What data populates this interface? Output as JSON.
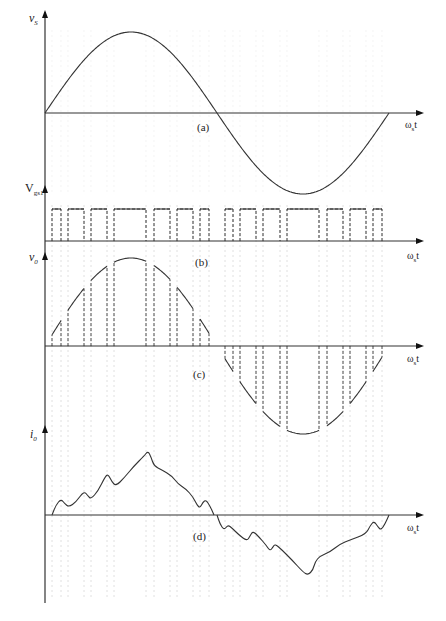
{
  "figure": {
    "stroke_color": "#333333",
    "grid_color": "#d8d8d8",
    "axis_x": 45,
    "axis_y_top": 8,
    "axis_y_bottom": 603,
    "x_end": 424,
    "period_start": 45,
    "period_end": 389
  },
  "panels": [
    {
      "id": "a",
      "caption": "(a)",
      "ylabel": "v",
      "ylabel_sub": "S",
      "xlabel": "ω",
      "xlabel_sub": "s",
      "xlabel_suffix": "t",
      "axis_y": 113,
      "ytop": 10,
      "caption_pos": [
        197,
        121
      ],
      "ylabel_pos": [
        29,
        11
      ],
      "xlabel_pos": [
        405,
        119
      ],
      "signal": "sine",
      "amplitude": 81
    },
    {
      "id": "b",
      "caption": "(b)",
      "ylabel": "V",
      "ylabel_sub": "gs1",
      "xlabel": "ω",
      "xlabel_sub": "s",
      "xlabel_suffix": "t",
      "axis_y": 241,
      "ytop": 185,
      "caption_pos": [
        195,
        256
      ],
      "ylabel_pos": [
        25,
        181
      ],
      "xlabel_pos": [
        407,
        250
      ],
      "signal": "pulses",
      "pulse_top": 209
    },
    {
      "id": "c",
      "caption": "(c)",
      "ylabel": "v",
      "ylabel_sub": "0",
      "xlabel": "ω",
      "xlabel_sub": "s",
      "xlabel_suffix": "t",
      "axis_y": 346,
      "ytop": 252,
      "caption_pos": [
        193,
        368
      ],
      "ylabel_pos": [
        29,
        250
      ],
      "xlabel_pos": [
        407,
        353
      ],
      "signal": "chopped_sine",
      "amplitude": 88
    },
    {
      "id": "d",
      "caption": "(d)",
      "ylabel": "i",
      "ylabel_sub": "0",
      "xlabel": "ω",
      "xlabel_sub": "s",
      "xlabel_suffix": "t",
      "axis_y": 515,
      "ytop": 425,
      "caption_pos": [
        193,
        530
      ],
      "ylabel_pos": [
        30,
        427
      ],
      "xlabel_pos": [
        407,
        522
      ],
      "signal": "current",
      "points_pos": [
        [
          52,
          515
        ],
        [
          56,
          505
        ],
        [
          61,
          499
        ],
        [
          65,
          504
        ],
        [
          69,
          507
        ],
        [
          76,
          502
        ],
        [
          84,
          491
        ],
        [
          88,
          496
        ],
        [
          91,
          499
        ],
        [
          98,
          491
        ],
        [
          105,
          477
        ],
        [
          108,
          474
        ],
        [
          112,
          482
        ],
        [
          116,
          486
        ],
        [
          124,
          478
        ],
        [
          134,
          466
        ],
        [
          144,
          456
        ],
        [
          148,
          451
        ],
        [
          151,
          457
        ],
        [
          154,
          466
        ],
        [
          162,
          470
        ],
        [
          172,
          476
        ],
        [
          178,
          484
        ],
        [
          186,
          489
        ],
        [
          193,
          497
        ],
        [
          197,
          505
        ],
        [
          200,
          508
        ],
        [
          203,
          502
        ],
        [
          206,
          500
        ],
        [
          210,
          506
        ],
        [
          214,
          515
        ]
      ],
      "points_neg": [
        [
          217,
          515
        ],
        [
          220,
          524
        ],
        [
          224,
          530
        ],
        [
          228,
          525
        ],
        [
          232,
          528
        ],
        [
          239,
          535
        ],
        [
          247,
          541
        ],
        [
          250,
          536
        ],
        [
          253,
          531
        ],
        [
          259,
          537
        ],
        [
          266,
          545
        ],
        [
          270,
          551
        ],
        [
          273,
          547
        ],
        [
          275,
          544
        ],
        [
          281,
          549
        ],
        [
          292,
          560
        ],
        [
          303,
          572
        ],
        [
          308,
          575
        ],
        [
          313,
          570
        ],
        [
          315,
          562
        ],
        [
          320,
          556
        ],
        [
          330,
          552
        ],
        [
          340,
          544
        ],
        [
          350,
          540
        ],
        [
          366,
          534
        ],
        [
          370,
          526
        ],
        [
          374,
          521
        ],
        [
          378,
          527
        ],
        [
          381,
          530
        ],
        [
          385,
          524
        ],
        [
          389,
          515
        ]
      ]
    }
  ],
  "pulses": [
    [
      52,
      61
    ],
    [
      68,
      84
    ],
    [
      91,
      107
    ],
    [
      114,
      146
    ],
    [
      154,
      170
    ],
    [
      177,
      193
    ],
    [
      200,
      209
    ],
    [
      225,
      233
    ],
    [
      240,
      256
    ],
    [
      263,
      280
    ],
    [
      287,
      319
    ],
    [
      327,
      343
    ],
    [
      350,
      366
    ],
    [
      373,
      382
    ]
  ],
  "chart_data": {
    "type": "line",
    "subplots": [
      {
        "label": "(a)",
        "ylabel": "v_S",
        "xlabel": "ω_s t",
        "description": "Sinusoidal supply voltage, one full period",
        "x": [
          0,
          90,
          180,
          270,
          360
        ],
        "y": [
          0,
          1,
          0,
          -1,
          0
        ]
      },
      {
        "label": "(b)",
        "ylabel": "V_gs1",
        "xlabel": "ω_s t",
        "description": "Gate pulse train, 7 pulses per half-cycle, widths wider near center",
        "pulse_count_per_half_cycle": 7
      },
      {
        "label": "(c)",
        "ylabel": "v_0",
        "xlabel": "ω_s t",
        "description": "Chopped output voltage following sine envelope during pulse ON intervals"
      },
      {
        "label": "(d)",
        "ylabel": "i_0",
        "xlabel": "ω_s t",
        "description": "Output current with ripple, lagging the voltage"
      }
    ]
  }
}
